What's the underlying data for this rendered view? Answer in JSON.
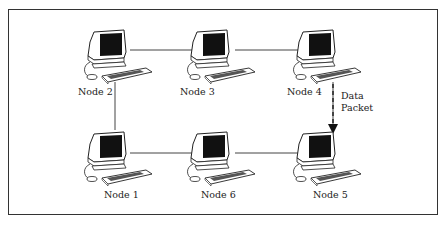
{
  "diagram": {
    "type": "ring network topology",
    "nodes": [
      {
        "id": "n2",
        "label": "Node 2"
      },
      {
        "id": "n3",
        "label": "Node 3"
      },
      {
        "id": "n4",
        "label": "Node 4"
      },
      {
        "id": "n1",
        "label": "Node 1"
      },
      {
        "id": "n6",
        "label": "Node 6"
      },
      {
        "id": "n5",
        "label": "Node 5"
      }
    ],
    "links": [
      [
        "n2",
        "n3"
      ],
      [
        "n3",
        "n4"
      ],
      [
        "n4",
        "n5"
      ],
      [
        "n5",
        "n6"
      ],
      [
        "n6",
        "n1"
      ],
      [
        "n1",
        "n2"
      ]
    ],
    "packet": {
      "label_line1": "Data",
      "label_line2": "Packet",
      "from": "n4",
      "to": "n5"
    }
  }
}
